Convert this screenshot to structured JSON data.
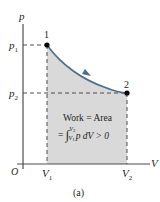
{
  "diagram": {
    "axes": {
      "y_label": "p",
      "x_label": "V",
      "origin_label": "O"
    },
    "points": [
      {
        "label": "1",
        "p": "p1",
        "V": "V1"
      },
      {
        "label": "2",
        "p": "p2",
        "V": "V2"
      }
    ],
    "y_ticks": {
      "p1": "p",
      "p1_sub": "1",
      "p2": "p",
      "p2_sub": "2"
    },
    "x_ticks": {
      "v1": "V",
      "v1_sub": "1",
      "v2": "V",
      "v2_sub": "2"
    },
    "annotation": {
      "line1": "Work = Area",
      "line2_prefix": "= ",
      "integral": "∫",
      "upper": "V",
      "upper_sub": "2",
      "lower": "V",
      "lower_sub": "1",
      "integrand": "p dV > 0"
    },
    "caption": "(a)",
    "colors": {
      "curve": "#4a6d8c",
      "fill": "#d9d9d9",
      "axis": "#4d4d4d",
      "dash": "#4d4d4d"
    }
  }
}
